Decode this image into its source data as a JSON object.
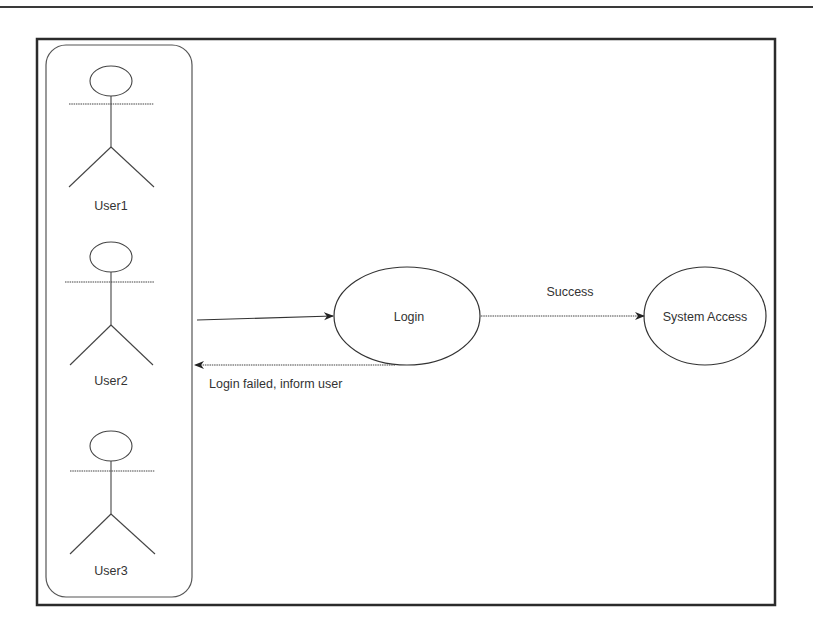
{
  "diagram": {
    "type": "use-case",
    "actors": [
      {
        "id": "user1",
        "label": "User1"
      },
      {
        "id": "user2",
        "label": "User2"
      },
      {
        "id": "user3",
        "label": "User3"
      }
    ],
    "use_cases": [
      {
        "id": "login",
        "label": "Login"
      },
      {
        "id": "system_access",
        "label": "System Access"
      }
    ],
    "edges": [
      {
        "from": "actors",
        "to": "login",
        "label": ""
      },
      {
        "from": "login",
        "to": "system_access",
        "label": "Success"
      },
      {
        "from": "login",
        "to": "actors",
        "label": "Login failed, inform user"
      }
    ],
    "colors": {
      "stroke": "#333333",
      "frame": "#2b2b2b",
      "background": "#ffffff"
    }
  }
}
